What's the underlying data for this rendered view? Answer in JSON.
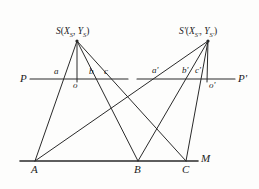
{
  "figure": {
    "type": "geometry-diagram",
    "stroke_color": "#2a2a2a",
    "background_color": "#fdfdfc"
  },
  "labels": {
    "station_left": {
      "name": "S",
      "coord_open": "(",
      "x_sym": "X",
      "x_sub": "S",
      "comma": ", ",
      "y_sym": "Y",
      "y_sub": "S",
      "coord_close": ")",
      "full": "S(XS, YS)"
    },
    "station_right": {
      "name": "S'",
      "coord_open": "(",
      "x_sym": "X",
      "x_sub": "S'",
      "comma": ", ",
      "y_sym": "Y",
      "y_sub": "S'",
      "coord_close": ")",
      "full": "S'(XS', YS')"
    },
    "ref_left_start": "P",
    "ref_right_end": "P'",
    "angle_a": "a",
    "angle_b": "b",
    "angle_c": "c",
    "angle_a_prime": "a'",
    "angle_b_prime": "b'",
    "angle_c_prime": "c'",
    "foot_left": "o",
    "foot_right": "o'",
    "base_A": "A",
    "base_B": "B",
    "base_C": "C",
    "base_M": "M"
  },
  "geometry": {
    "station_left_point": {
      "x": 77,
      "y": 41
    },
    "station_right_point": {
      "x": 208,
      "y": 41
    },
    "foot_left_point": {
      "x": 77,
      "y": 79
    },
    "foot_right_point": {
      "x": 207,
      "y": 79
    },
    "ref_line_y": 79,
    "ref_line_left": {
      "x1": 30,
      "x2": 128
    },
    "ref_line_right": {
      "x1": 137,
      "x2": 235
    },
    "base_line_y": 161,
    "base_line": {
      "x1": 20,
      "x2": 198
    },
    "base_A_point": {
      "x": 35,
      "y": 161
    },
    "base_B_point": {
      "x": 138,
      "y": 161
    },
    "base_C_point": {
      "x": 186,
      "y": 161
    }
  }
}
